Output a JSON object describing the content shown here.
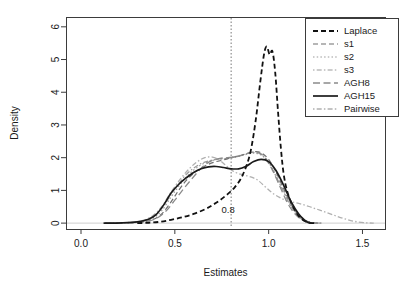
{
  "chart_data": {
    "type": "line",
    "title": "",
    "xlabel": "Estimates",
    "ylabel": "Density",
    "xlim": [
      -0.08,
      1.62
    ],
    "ylim": [
      -0.18,
      6.3
    ],
    "xticks": [
      "0.0",
      "0.5",
      "1.0",
      "1.5"
    ],
    "xtick_values": [
      0.0,
      0.5,
      1.0,
      1.5
    ],
    "yticks": [
      "0",
      "1",
      "2",
      "3",
      "4",
      "5",
      "6"
    ],
    "ytick_values": [
      0,
      1,
      2,
      3,
      4,
      5,
      6
    ],
    "grid": false,
    "legend_position": "top-right",
    "annotations": [
      {
        "text": "0.8",
        "x": 0.8,
        "y": 0.32,
        "name": "reference-value-label"
      }
    ],
    "reference_lines": [
      {
        "orientation": "vertical",
        "x": 0.8,
        "style": "dotted",
        "color": "#777777"
      }
    ],
    "series": [
      {
        "name": "Laplace",
        "style": "dashed",
        "color": "#111111",
        "width": 1.8,
        "points": [
          [
            0.3,
            0.0
          ],
          [
            0.36,
            0.01
          ],
          [
            0.42,
            0.04
          ],
          [
            0.48,
            0.1
          ],
          [
            0.54,
            0.18
          ],
          [
            0.6,
            0.28
          ],
          [
            0.66,
            0.42
          ],
          [
            0.7,
            0.55
          ],
          [
            0.74,
            0.7
          ],
          [
            0.78,
            0.88
          ],
          [
            0.82,
            1.1
          ],
          [
            0.86,
            1.45
          ],
          [
            0.9,
            2.1
          ],
          [
            0.93,
            3.1
          ],
          [
            0.955,
            4.3
          ],
          [
            0.975,
            5.15
          ],
          [
            0.99,
            5.4
          ],
          [
            1.005,
            5.15
          ],
          [
            1.02,
            5.25
          ],
          [
            1.035,
            4.6
          ],
          [
            1.05,
            3.4
          ],
          [
            1.065,
            2.3
          ],
          [
            1.08,
            1.5
          ],
          [
            1.1,
            0.95
          ],
          [
            1.13,
            0.5
          ],
          [
            1.16,
            0.22
          ],
          [
            1.19,
            0.07
          ],
          [
            1.22,
            0.01
          ],
          [
            1.25,
            0.0
          ]
        ]
      },
      {
        "name": "s1",
        "style": "dashed",
        "color": "#6e6e6e",
        "width": 1.2,
        "points": [
          [
            0.13,
            0.0
          ],
          [
            0.25,
            0.01
          ],
          [
            0.33,
            0.04
          ],
          [
            0.38,
            0.1
          ],
          [
            0.43,
            0.28
          ],
          [
            0.48,
            0.65
          ],
          [
            0.52,
            1.0
          ],
          [
            0.56,
            1.3
          ],
          [
            0.6,
            1.52
          ],
          [
            0.64,
            1.68
          ],
          [
            0.68,
            1.8
          ],
          [
            0.72,
            1.88
          ],
          [
            0.76,
            1.93
          ],
          [
            0.8,
            2.0
          ],
          [
            0.84,
            2.05
          ],
          [
            0.88,
            2.12
          ],
          [
            0.92,
            2.18
          ],
          [
            0.96,
            2.15
          ],
          [
            1.0,
            1.95
          ],
          [
            1.04,
            1.55
          ],
          [
            1.08,
            1.05
          ],
          [
            1.12,
            0.58
          ],
          [
            1.16,
            0.25
          ],
          [
            1.2,
            0.07
          ],
          [
            1.24,
            0.01
          ],
          [
            1.28,
            0.0
          ]
        ]
      },
      {
        "name": "s2",
        "style": "dotted",
        "color": "#9a9a9a",
        "width": 1.2,
        "points": [
          [
            0.13,
            0.0
          ],
          [
            0.26,
            0.01
          ],
          [
            0.33,
            0.05
          ],
          [
            0.38,
            0.14
          ],
          [
            0.43,
            0.38
          ],
          [
            0.48,
            0.8
          ],
          [
            0.52,
            1.12
          ],
          [
            0.56,
            1.4
          ],
          [
            0.6,
            1.62
          ],
          [
            0.64,
            1.78
          ],
          [
            0.68,
            1.88
          ],
          [
            0.72,
            1.94
          ],
          [
            0.76,
            1.96
          ],
          [
            0.8,
            1.99
          ],
          [
            0.84,
            2.04
          ],
          [
            0.88,
            2.1
          ],
          [
            0.92,
            2.14
          ],
          [
            0.96,
            2.08
          ],
          [
            1.0,
            1.85
          ],
          [
            1.04,
            1.45
          ],
          [
            1.08,
            0.98
          ],
          [
            1.12,
            0.52
          ],
          [
            1.16,
            0.22
          ],
          [
            1.2,
            0.06
          ],
          [
            1.24,
            0.01
          ],
          [
            1.28,
            0.0
          ]
        ]
      },
      {
        "name": "s3",
        "style": "dotdash",
        "color": "#9a9a9a",
        "width": 1.2,
        "points": [
          [
            0.13,
            0.0
          ],
          [
            0.26,
            0.01
          ],
          [
            0.33,
            0.06
          ],
          [
            0.38,
            0.18
          ],
          [
            0.43,
            0.45
          ],
          [
            0.48,
            0.88
          ],
          [
            0.52,
            1.2
          ],
          [
            0.56,
            1.48
          ],
          [
            0.6,
            1.68
          ],
          [
            0.64,
            1.82
          ],
          [
            0.68,
            1.9
          ],
          [
            0.72,
            1.95
          ],
          [
            0.76,
            1.97
          ],
          [
            0.8,
            2.0
          ],
          [
            0.84,
            2.06
          ],
          [
            0.88,
            2.12
          ],
          [
            0.92,
            2.16
          ],
          [
            0.96,
            2.1
          ],
          [
            1.0,
            1.86
          ],
          [
            1.04,
            1.42
          ],
          [
            1.08,
            0.95
          ],
          [
            1.12,
            0.5
          ],
          [
            1.16,
            0.2
          ],
          [
            1.2,
            0.05
          ],
          [
            1.24,
            0.01
          ],
          [
            1.28,
            0.0
          ]
        ]
      },
      {
        "name": "AGH8",
        "style": "longdash",
        "color": "#8a8a8a",
        "width": 1.3,
        "points": [
          [
            0.13,
            0.0
          ],
          [
            0.28,
            0.01
          ],
          [
            0.35,
            0.05
          ],
          [
            0.4,
            0.14
          ],
          [
            0.45,
            0.35
          ],
          [
            0.5,
            0.7
          ],
          [
            0.54,
            1.0
          ],
          [
            0.58,
            1.28
          ],
          [
            0.62,
            1.55
          ],
          [
            0.66,
            1.78
          ],
          [
            0.7,
            1.92
          ],
          [
            0.74,
            1.98
          ],
          [
            0.78,
            2.0
          ],
          [
            0.82,
            2.02
          ],
          [
            0.86,
            2.08
          ],
          [
            0.9,
            2.15
          ],
          [
            0.94,
            2.18
          ],
          [
            0.98,
            2.0
          ],
          [
            1.02,
            1.62
          ],
          [
            1.06,
            1.12
          ],
          [
            1.1,
            0.62
          ],
          [
            1.14,
            0.28
          ],
          [
            1.18,
            0.09
          ],
          [
            1.22,
            0.01
          ],
          [
            1.26,
            0.0
          ]
        ]
      },
      {
        "name": "AGH15",
        "style": "solid",
        "color": "#1a1a1a",
        "width": 1.7,
        "points": [
          [
            0.12,
            0.0
          ],
          [
            0.22,
            0.01
          ],
          [
            0.3,
            0.04
          ],
          [
            0.36,
            0.12
          ],
          [
            0.4,
            0.26
          ],
          [
            0.44,
            0.55
          ],
          [
            0.48,
            0.92
          ],
          [
            0.52,
            1.18
          ],
          [
            0.56,
            1.38
          ],
          [
            0.6,
            1.55
          ],
          [
            0.64,
            1.66
          ],
          [
            0.68,
            1.72
          ],
          [
            0.72,
            1.73
          ],
          [
            0.76,
            1.7
          ],
          [
            0.8,
            1.66
          ],
          [
            0.84,
            1.66
          ],
          [
            0.88,
            1.74
          ],
          [
            0.92,
            1.88
          ],
          [
            0.96,
            1.95
          ],
          [
            1.0,
            1.88
          ],
          [
            1.04,
            1.6
          ],
          [
            1.08,
            1.15
          ],
          [
            1.12,
            0.65
          ],
          [
            1.16,
            0.28
          ],
          [
            1.19,
            0.1
          ],
          [
            1.21,
            0.02
          ],
          [
            1.23,
            0.0
          ]
        ]
      },
      {
        "name": "Pairwise",
        "style": "dotdash",
        "color": "#b0b0b0",
        "width": 1.3,
        "points": [
          [
            0.13,
            0.0
          ],
          [
            0.26,
            0.02
          ],
          [
            0.33,
            0.08
          ],
          [
            0.38,
            0.22
          ],
          [
            0.43,
            0.5
          ],
          [
            0.48,
            0.95
          ],
          [
            0.53,
            1.35
          ],
          [
            0.58,
            1.68
          ],
          [
            0.62,
            1.88
          ],
          [
            0.66,
            2.0
          ],
          [
            0.7,
            2.02
          ],
          [
            0.74,
            1.92
          ],
          [
            0.78,
            1.72
          ],
          [
            0.82,
            1.56
          ],
          [
            0.86,
            1.48
          ],
          [
            0.9,
            1.42
          ],
          [
            0.94,
            1.32
          ],
          [
            0.98,
            1.12
          ],
          [
            1.02,
            0.92
          ],
          [
            1.06,
            0.78
          ],
          [
            1.1,
            0.68
          ],
          [
            1.16,
            0.6
          ],
          [
            1.22,
            0.5
          ],
          [
            1.28,
            0.38
          ],
          [
            1.34,
            0.26
          ],
          [
            1.4,
            0.14
          ],
          [
            1.46,
            0.05
          ],
          [
            1.52,
            0.01
          ],
          [
            1.56,
            0.0
          ]
        ]
      }
    ]
  }
}
